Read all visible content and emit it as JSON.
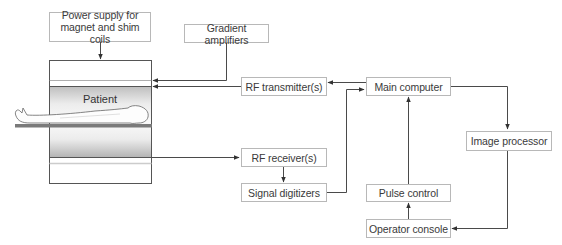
{
  "diagram": {
    "title": "",
    "type": "block-diagram",
    "nodes": {
      "power_supply": "Power supply for magnet and shim coils",
      "power_supply_line1": "Power supply for",
      "power_supply_line2": "magnet and shim coils",
      "gradient_amplifiers": "Gradient amplifiers",
      "rf_transmitter": "RF transmitter(s)",
      "main_computer": "Main computer",
      "image_processor": "Image processor",
      "rf_receiver": "RF receiver(s)",
      "signal_digitizers": "Signal digitizers",
      "pulse_control": "Pulse control",
      "operator_console": "Operator console",
      "patient": "Patient"
    },
    "edges": [
      {
        "from": "Power supply for magnet and shim coils",
        "to": "Magnet"
      },
      {
        "from": "Gradient amplifiers",
        "to": "Magnet"
      },
      {
        "from": "RF transmitter(s)",
        "to": "Magnet"
      },
      {
        "from": "Main computer",
        "to": "RF transmitter(s)"
      },
      {
        "from": "Magnet",
        "to": "RF receiver(s)"
      },
      {
        "from": "RF receiver(s)",
        "to": "Signal digitizers"
      },
      {
        "from": "Signal digitizers",
        "to": "Main computer"
      },
      {
        "from": "Main computer",
        "to": "Image processor"
      },
      {
        "from": "Image processor",
        "to": "Operator console"
      },
      {
        "from": "Operator console",
        "to": "Pulse control"
      },
      {
        "from": "Pulse control",
        "to": "Main computer"
      }
    ],
    "colors": {
      "line": "#4a4a4a",
      "box_border": "#b8b8b8",
      "text": "#3a3a3a",
      "bore_gradient_top": "#cfcfcf",
      "bore_gradient_mid": "#f4f4f4",
      "table": "#7a7a7a"
    }
  }
}
